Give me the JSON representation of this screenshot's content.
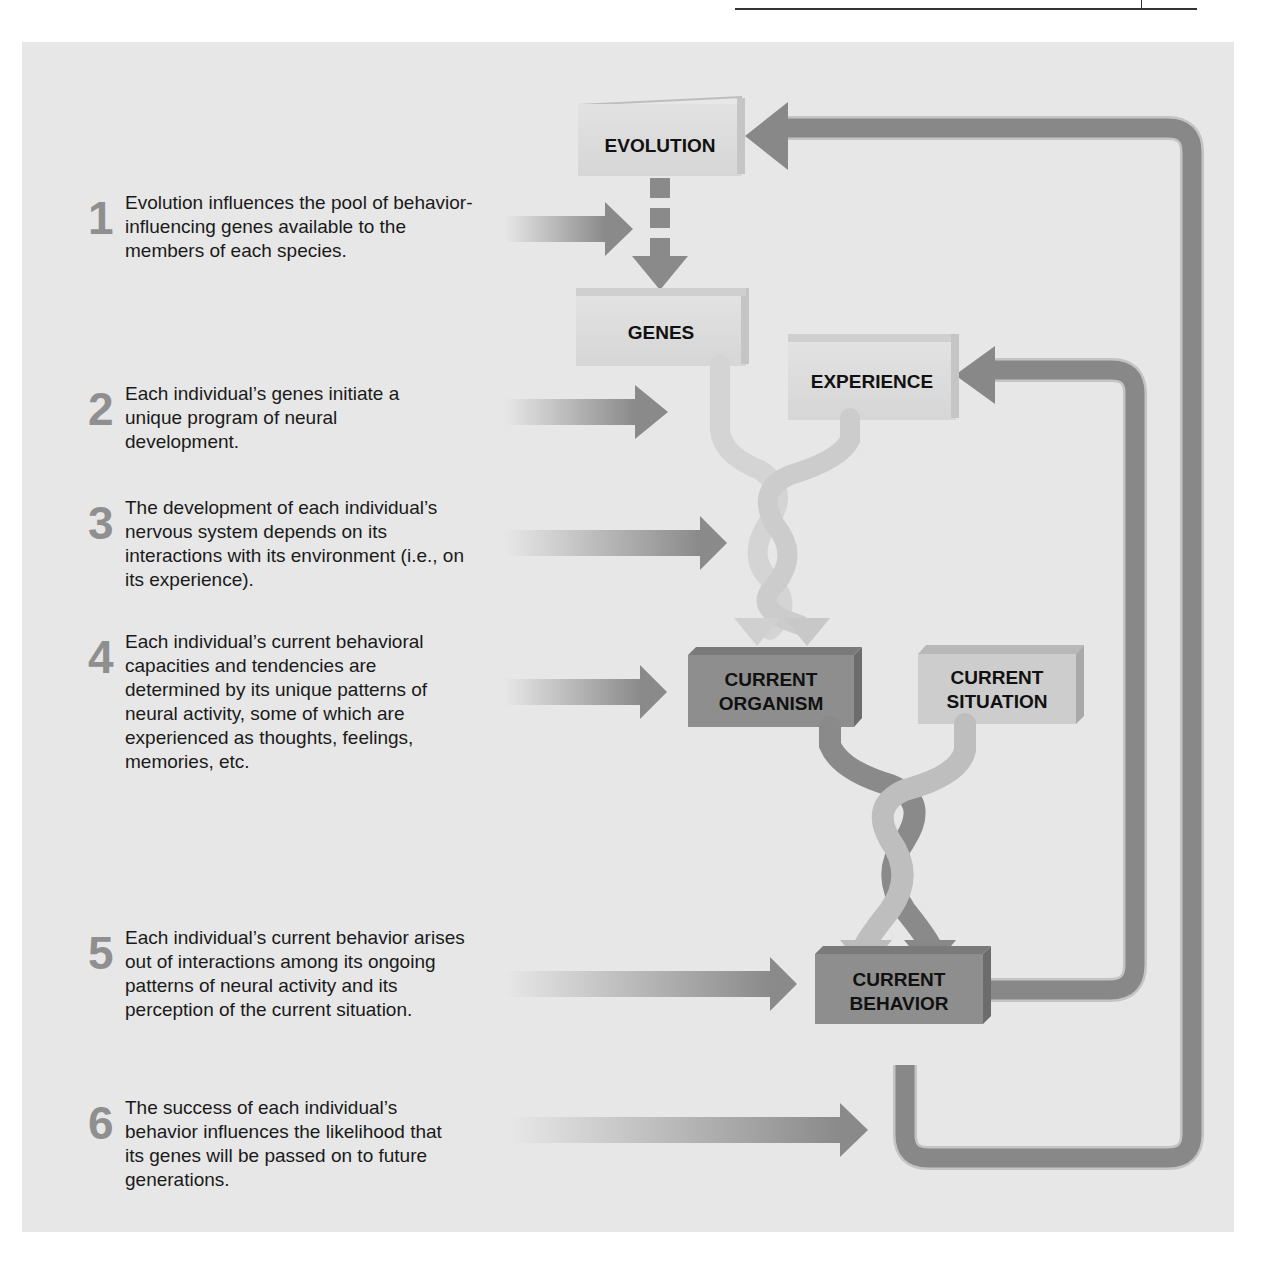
{
  "header": {
    "rule": "page-header-rule"
  },
  "diagram": {
    "boxes": {
      "evolution": "EVOLUTION",
      "genes": "GENES",
      "experience": "EXPERIENCE",
      "current_organism_line1": "CURRENT",
      "current_organism_line2": "ORGANISM",
      "current_situation_line1": "CURRENT",
      "current_situation_line2": "SITUATION",
      "current_behavior_line1": "CURRENT",
      "current_behavior_line2": "BEHAVIOR"
    },
    "colors": {
      "panel": "#e7e7e7",
      "light_box": "#dadada",
      "dark_box": "#8e8e8e",
      "arrow": "#8a8a8a",
      "step_number": "#8f8f8f"
    }
  },
  "steps": [
    {
      "number": "1",
      "text": "Evolution influences the pool of behavior-influencing genes available to the members of each species."
    },
    {
      "number": "2",
      "text": "Each individual’s genes initiate a unique program of neural development."
    },
    {
      "number": "3",
      "text": "The development of each individual’s nervous system depends on its interactions with its environment (i.e., on its experience)."
    },
    {
      "number": "4",
      "text": "Each individual’s current behavioral capacities and tendencies are determined by its unique patterns of neural activity, some of which are experienced as thoughts, feelings, memories, etc."
    },
    {
      "number": "5",
      "text": "Each individual’s current behavior arises out of interactions among its ongoing patterns of neural activity and its perception of the current situation."
    },
    {
      "number": "6",
      "text": "The success of each individual’s behavior influences the likelihood that its genes will be passed on to future generations."
    }
  ]
}
